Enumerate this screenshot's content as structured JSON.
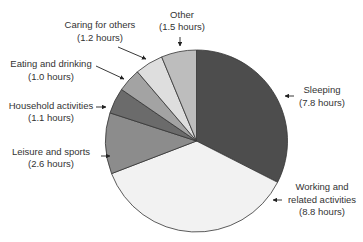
{
  "chart_data": {
    "type": "pie",
    "title": "",
    "unit": "hours",
    "start_angle_deg": 0,
    "direction": "clockwise",
    "total": 24.0,
    "slices": [
      {
        "label": "Sleeping",
        "value": 7.8,
        "value_label": "(7.8 hours)",
        "color": "#4d4d4d"
      },
      {
        "label": "Working and related activities",
        "value": 8.8,
        "value_label": "(8.8 hours)",
        "color": "#f2f2f2"
      },
      {
        "label": "Leisure and sports",
        "value": 2.6,
        "value_label": "(2.6 hours)",
        "color": "#8c8c8c"
      },
      {
        "label": "Household activities",
        "value": 1.1,
        "value_label": "(1.1 hours)",
        "color": "#6b6b6b"
      },
      {
        "label": "Eating and drinking",
        "value": 1.0,
        "value_label": "(1.0 hours)",
        "color": "#a3a3a3"
      },
      {
        "label": "Caring for others",
        "value": 1.2,
        "value_label": "(1.2 hours)",
        "color": "#dedede"
      },
      {
        "label": "Other",
        "value": 1.5,
        "value_label": "(1.5 hours)",
        "color": "#bdbdbd"
      }
    ],
    "legend": "none (callout labels with arrows)"
  },
  "labels": {
    "sleeping": {
      "line1": "Sleeping",
      "line2": "(7.8 hours)"
    },
    "working": {
      "line1": "Working and",
      "line2": "related activities",
      "line3": "(8.8 hours)"
    },
    "leisure": {
      "line1": "Leisure and sports",
      "line2": "(2.6 hours)"
    },
    "household": {
      "line1": "Household activities",
      "line2": "(1.1 hours)"
    },
    "eating": {
      "line1": "Eating and drinking",
      "line2": "(1.0 hours)"
    },
    "caring": {
      "line1": "Caring for others",
      "line2": "(1.2 hours)"
    },
    "other": {
      "line1": "Other",
      "line2": "(1.5 hours)"
    }
  }
}
